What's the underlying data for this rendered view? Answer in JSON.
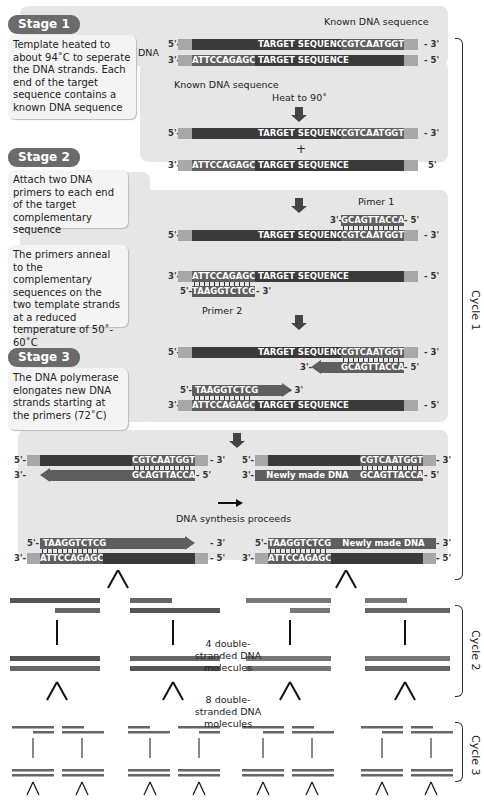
{
  "stages": [
    {
      "tag": "Stage 1",
      "text": "Template heated to about 94˚C to seperate the DNA strands. Each end of the target sequence contains a known DNA sequence"
    },
    {
      "tag": "Stage 2",
      "text": "Attach two DNA primers to each end of the target complementary sequence",
      "text2": "The primers anneal to the complementary sequences on the two template strands at a reduced temperature of 50˚- 60˚C"
    },
    {
      "tag": "Stage 3",
      "text": "The DNA polymerase elongates new DNA strands starting at the primers (72˚C)"
    }
  ],
  "labels": {
    "dna": "DNA",
    "known_top": "Known DNA sequence",
    "known_bottom": "Known DNA sequence",
    "heat": "Heat to 90˚",
    "plus": "+",
    "primer1": "Pimer 1",
    "primer2": "Primer 2",
    "synthesis": "DNA synthesis proceeds",
    "four_molecules": "4 double-stranded DNA molecules",
    "eight_molecules": "8 double-stranded DNA molecules",
    "cycle1": "Cycle 1",
    "cycle2": "Cycle 2",
    "cycle3": "Cycle 3"
  },
  "sequences": {
    "target": "TARGET SEQUENCE",
    "known_top": "CGTCAATGGT",
    "known_bottom": "ATTCCAGAGC",
    "primer1": "GCAGTTACCA",
    "primer2": "TAAGGTCTCG",
    "newly_made": "Newly made DNA"
  },
  "ends": {
    "five": "5'-",
    "three": "3'-",
    "r3": "- 3'",
    "r5": "- 5'",
    "five_plain": "5'"
  },
  "colors": {
    "panel": "#e6e6e6",
    "strand_dark": "#3a3a3a",
    "segment": "#5e5e5e",
    "cap": "#a8a8a8",
    "stage_tag": "#6b6b6b"
  }
}
